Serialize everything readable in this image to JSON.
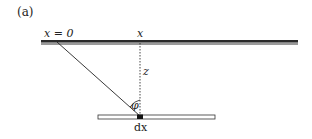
{
  "panel_label": "(a)",
  "labels": {
    "origin": "x = 0",
    "x": "x",
    "z": "z",
    "phi": "φ",
    "dx": "dx"
  },
  "colors": {
    "upper_bar": "#555555",
    "upper_bar_shadow": "#999999",
    "lower_bar_fill": "#ffffff",
    "lower_bar_stroke": "#333333",
    "line": "#222222"
  }
}
